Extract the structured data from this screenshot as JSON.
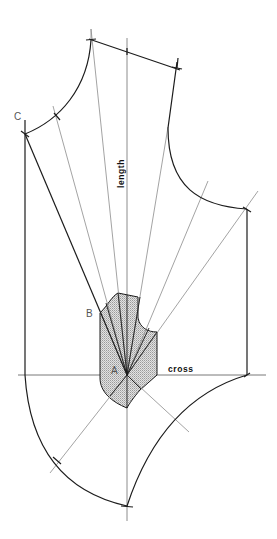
{
  "diagram": {
    "type": "pattern-drafting construction",
    "labels": {
      "point_c": "C",
      "point_b": "B",
      "point_a": "A",
      "length_axis": "length",
      "cross_axis": "cross"
    },
    "colors": {
      "line_dark": "#1c1c1c",
      "line_light": "#8c8c8c",
      "shading": "#cfcfcf",
      "background": "#ffffff"
    },
    "points": {
      "A": [
        127,
        375
      ],
      "B": [
        100,
        313
      ],
      "C": [
        25,
        134
      ]
    }
  }
}
